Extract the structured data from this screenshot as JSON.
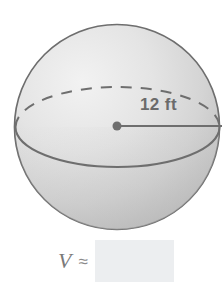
{
  "figure": {
    "name": "sphere-volume-problem",
    "shape": "sphere",
    "shading": {
      "fill_light": "#f0f0f0",
      "fill_mid": "#dedede",
      "fill_dark": "#bcbcbc",
      "outline_color": "#6e6e6e"
    },
    "sphere": {
      "center_x": 117,
      "center_y": 127,
      "radius_px": 103,
      "top_y": 24,
      "bottom_y": 231,
      "left_x": 15,
      "right_x": 220
    },
    "equator": {
      "front_arc_style": "solid",
      "back_arc_style": "dashed",
      "semi_major_px": 102,
      "semi_minor_px": 40
    },
    "center_dot": {
      "x": 117,
      "y": 126,
      "radius_px": 4.5,
      "color": "#6e6e6e"
    },
    "radius_line": {
      "from_x": 117,
      "from_y": 126,
      "to_x": 222,
      "to_y": 126,
      "color": "#6e6e6e",
      "label": "12 ft",
      "measure_value": "12",
      "measure_unit": "ft"
    }
  },
  "answer": {
    "symbol": "V",
    "relation": "≈",
    "value": "",
    "placeholder": "",
    "box_fill": "#eceef0"
  }
}
